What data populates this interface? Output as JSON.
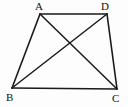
{
  "figure": {
    "kind": "quadrilateral-with-diagonals",
    "name": "trapezoid-ABCD",
    "background_color": "#fdfdfd",
    "stroke_color": "#1a1a1a",
    "label_color": "#111111",
    "canvas": {
      "width": 128,
      "height": 107
    },
    "vertices": [
      {
        "id": "A",
        "label": "A",
        "x": 40,
        "y": 14,
        "label_x": 35,
        "label_y": 1
      },
      {
        "id": "D",
        "label": "D",
        "x": 107,
        "y": 14,
        "label_x": 101,
        "label_y": 1
      },
      {
        "id": "B",
        "label": "B",
        "x": 12,
        "y": 88,
        "label_x": 6,
        "label_y": 92
      },
      {
        "id": "C",
        "label": "C",
        "x": 117,
        "y": 89,
        "label_x": 112,
        "label_y": 93
      }
    ],
    "edges": [
      {
        "id": "AD",
        "from": "A",
        "to": "D",
        "role": "top-side"
      },
      {
        "id": "DC",
        "from": "D",
        "to": "C",
        "role": "right-side"
      },
      {
        "id": "CB",
        "from": "C",
        "to": "B",
        "role": "bottom-side"
      },
      {
        "id": "BA",
        "from": "B",
        "to": "A",
        "role": "left-side"
      }
    ],
    "diagonals": [
      {
        "id": "AC",
        "from": "A",
        "to": "C",
        "role": "diagonal"
      },
      {
        "id": "BD",
        "from": "B",
        "to": "D",
        "role": "diagonal"
      }
    ],
    "intersection": {
      "id": "O",
      "x": 65,
      "y": 42,
      "labeled": false
    }
  }
}
